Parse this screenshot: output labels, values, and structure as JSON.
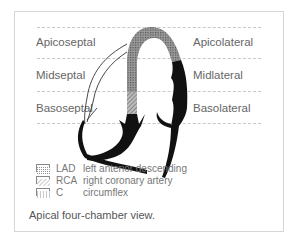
{
  "segments": {
    "left": [
      "Apicoseptal",
      "Midseptal",
      "Basoseptal"
    ],
    "right": [
      "Apicolateral",
      "Midlateral",
      "Basolateral"
    ]
  },
  "legend": [
    {
      "pattern": "dotted",
      "abbr": "LAD",
      "label": "left anterior descending"
    },
    {
      "pattern": "hatched",
      "abbr": "RCA",
      "label": "right coronary artery"
    },
    {
      "pattern": "grid",
      "abbr": "C",
      "label": "circumflex"
    }
  ],
  "caption": "Apical four-chamber view.",
  "colors": {
    "frame": "#d6d6d6",
    "dash": "#c8c8c8",
    "myocardium_black": "#111111",
    "lad_fill": "#8c8c8c",
    "rca_fill": "#a0a0a0"
  }
}
